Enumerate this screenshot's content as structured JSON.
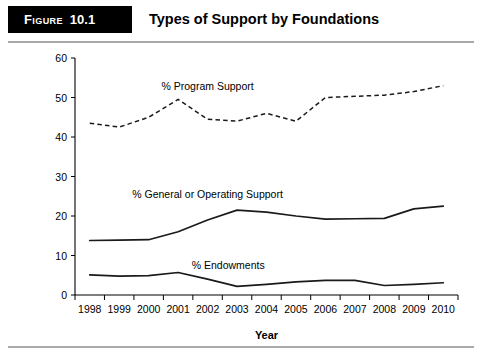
{
  "figure": {
    "tag_label": "Figure",
    "tag_number": "10.1",
    "title": "Types of Support by Foundations"
  },
  "chart_data": {
    "type": "line",
    "title": "Types of Support by Foundations",
    "xlabel": "Year",
    "ylabel": "",
    "x": [
      1998,
      1999,
      2000,
      2001,
      2002,
      2003,
      2004,
      2005,
      2006,
      2007,
      2008,
      2009,
      2010
    ],
    "categories": [
      "1998",
      "1999",
      "2000",
      "2001",
      "2002",
      "2003",
      "2004",
      "2005",
      "2006",
      "2007",
      "2008",
      "2009",
      "2010"
    ],
    "xlim": [
      1998,
      2010
    ],
    "ylim": [
      0,
      60
    ],
    "yticks": [
      0,
      10,
      20,
      30,
      40,
      50,
      60
    ],
    "ytick_labels": [
      "0",
      "10",
      "20",
      "30",
      "40",
      "50",
      "60"
    ],
    "grid": false,
    "legend": "inline-labels",
    "series": [
      {
        "name": "% Program Support",
        "style": "dashed",
        "color": "#1a1a1a",
        "label_x": 2002,
        "label_y": 53,
        "values": [
          43.5,
          42.5,
          45.0,
          49.5,
          44.5,
          44.0,
          46.0,
          44.0,
          50.0,
          50.3,
          50.6,
          51.5,
          53.0
        ]
      },
      {
        "name": "% General or Operating Support",
        "style": "solid",
        "color": "#1a1a1a",
        "label_x": 2002,
        "label_y": 25.5,
        "values": [
          13.8,
          13.9,
          14.0,
          16.0,
          19.0,
          21.5,
          21.0,
          20.0,
          19.2,
          19.3,
          19.4,
          21.8,
          22.5
        ]
      },
      {
        "name": "% Endowments",
        "style": "solid",
        "color": "#1a1a1a",
        "label_x": 2002.7,
        "label_y": 7.6,
        "values": [
          5.1,
          4.8,
          4.9,
          5.7,
          4.0,
          2.2,
          2.7,
          3.3,
          3.7,
          3.7,
          2.4,
          2.7,
          3.1
        ]
      }
    ]
  }
}
